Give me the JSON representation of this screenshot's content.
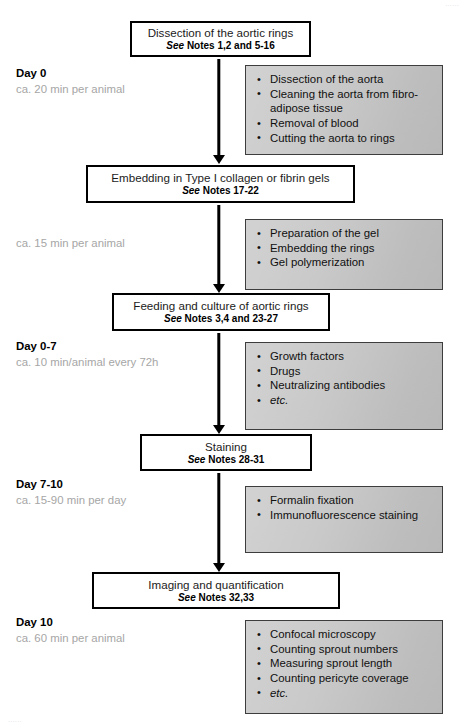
{
  "figure": {
    "type": "flowchart",
    "orientation": "vertical",
    "cropped_text_top": "......",
    "cropped_text_bottom": "......"
  },
  "steps": [
    {
      "id": "dissection",
      "title": "Dissection of the aortic rings",
      "notes_prefix": "See",
      "notes_text": "Notes 1,2 and 5-16"
    },
    {
      "id": "embedding",
      "title": "Embedding in Type I collagen or fibrin gels",
      "notes_prefix": "See",
      "notes_text": "Notes 17-22"
    },
    {
      "id": "feeding",
      "title": "Feeding and culture of aortic rings",
      "notes_prefix": "See",
      "notes_text": "Notes 3,4 and 23-27"
    },
    {
      "id": "staining",
      "title": "Staining",
      "notes_prefix": "See",
      "notes_text": "Notes 28-31"
    },
    {
      "id": "imaging",
      "title": "Imaging and quantification",
      "notes_prefix": "See",
      "notes_text": "Notes 32,33"
    }
  ],
  "phases": [
    {
      "id": "day-0",
      "day": "Day 0",
      "duration": "ca. 20 min per animal"
    },
    {
      "id": "day-0-b",
      "day": "",
      "duration": "ca. 15 min per animal"
    },
    {
      "id": "day-0-7",
      "day": "Day 0-7",
      "duration": "ca. 10 min/animal every 72h"
    },
    {
      "id": "day-7-10",
      "day": "Day 7-10",
      "duration": "ca. 15-90 min per day"
    },
    {
      "id": "day-10",
      "day": "Day 10",
      "duration": "ca. 60 min per animal"
    }
  ],
  "details": [
    {
      "id": "dissection-details",
      "items": [
        {
          "text": "Dissection of the aorta",
          "italic": false
        },
        {
          "text": "Cleaning the aorta from fibro-adipose tissue",
          "italic": false
        },
        {
          "text": "Removal of blood",
          "italic": false
        },
        {
          "text": "Cutting the aorta to rings",
          "italic": false
        }
      ]
    },
    {
      "id": "embedding-details",
      "items": [
        {
          "text": "Preparation of the gel",
          "italic": false
        },
        {
          "text": "Embedding the rings",
          "italic": false
        },
        {
          "text": "Gel polymerization",
          "italic": false
        }
      ]
    },
    {
      "id": "feeding-details",
      "items": [
        {
          "text": "Growth factors",
          "italic": false
        },
        {
          "text": "Drugs",
          "italic": false
        },
        {
          "text": "Neutralizing antibodies",
          "italic": false
        },
        {
          "text": "etc.",
          "italic": true
        }
      ]
    },
    {
      "id": "staining-details",
      "items": [
        {
          "text": "Formalin fixation",
          "italic": false
        },
        {
          "text": "Immunofluorescence staining",
          "italic": false
        }
      ]
    },
    {
      "id": "imaging-details",
      "items": [
        {
          "text": "Confocal microscopy",
          "italic": false
        },
        {
          "text": "Counting sprout numbers",
          "italic": false
        },
        {
          "text": "Measuring sprout length",
          "italic": false
        },
        {
          "text": "Counting pericyte coverage",
          "italic": false
        },
        {
          "text": "etc.",
          "italic": true
        }
      ]
    }
  ],
  "colors": {
    "box_border": "#000000",
    "box_fill": "#ffffff",
    "detail_fill": "#c9c9c9",
    "detail_border": "#3d3d3d",
    "duration_text": "#a6a6a6",
    "body_text": "#000000"
  },
  "bullet_glyph": "•"
}
